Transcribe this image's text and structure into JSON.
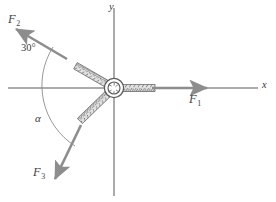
{
  "figure": {
    "kind": "free-body-diagram",
    "axes": {
      "x_label": "x",
      "y_label": "y",
      "origin": {
        "x": 114,
        "y": 88
      },
      "x_axis": {
        "x1": 8,
        "y1": 88,
        "x2": 258,
        "y2": 88
      },
      "y_axis": {
        "x1": 114,
        "y1": 8,
        "x2": 114,
        "y2": 196
      }
    },
    "colors": {
      "arrow": "#8d8d8d",
      "axis": "#8f8f8f",
      "rope_stroke": "#5f5f5f",
      "rope_fill": "#dedede",
      "ring": "#5a5a5a",
      "arc": "#7a7a7a",
      "text": "#3c3c3c",
      "background": "#ffffff"
    },
    "ring": {
      "cx": 114,
      "cy": 88,
      "r_outer": 9.5,
      "r_inner": 6.0
    },
    "forces": [
      {
        "id": "F1",
        "label": "F",
        "subscript": "1",
        "direction_deg": 0,
        "arrow": {
          "x1": 150,
          "y1": 88,
          "x2": 205,
          "y2": 88
        },
        "label_pos": {
          "x": 191,
          "y": 95
        },
        "rope": {
          "x1": 122,
          "y1": 88,
          "x2": 152,
          "y2": 88
        }
      },
      {
        "id": "F2",
        "label": "F",
        "subscript": "2",
        "direction_deg": 150,
        "arrow": {
          "x1": 65,
          "y1": 58,
          "x2": 14,
          "y2": 28
        },
        "label_pos": {
          "x": 9,
          "y": 14
        },
        "rope": {
          "x1": 108,
          "y1": 82,
          "x2": 69,
          "y2": 60
        }
      },
      {
        "id": "F3",
        "label": "F",
        "subscript": "3",
        "direction_deg": -112,
        "arrow": {
          "x1": 80,
          "y1": 126,
          "x2": 53,
          "y2": 180
        },
        "label_pos": {
          "x": 34,
          "y": 168
        },
        "rope": {
          "x1": 111,
          "y1": 96,
          "x2": 82,
          "y2": 124
        }
      }
    ],
    "angles": [
      {
        "id": "angle-30",
        "label": "30°",
        "label_pos": {
          "x": 22,
          "y": 46
        },
        "measured_from": "negative-x-axis",
        "measured_to": "F2"
      },
      {
        "id": "angle-alpha",
        "label": "α",
        "label_pos": {
          "x": 36,
          "y": 117
        },
        "measured_from": "negative-x-axis",
        "measured_to": "F3"
      }
    ],
    "arc": {
      "path": "M 52 48 A 70 70 0 0 0 74 145",
      "note": "single continuous arc from F2 line through negative x-axis to F3 line"
    }
  }
}
